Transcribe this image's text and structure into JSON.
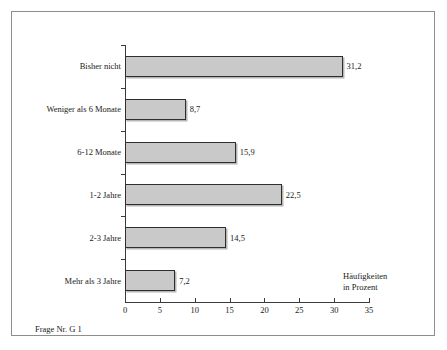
{
  "chart_data": {
    "type": "bar",
    "orientation": "horizontal",
    "title": "",
    "xlabel": "Häufigkeiten in Prozent",
    "ylabel": "",
    "categories": [
      "Bisher nicht",
      "Weniger als 6 Monate",
      "6-12 Monate",
      "1-2 Jahre",
      "2-3 Jahre",
      "Mehr als 3 Jahre"
    ],
    "values": [
      31.2,
      8.7,
      15.9,
      22.5,
      14.5,
      7.2
    ],
    "value_labels": [
      "31,2",
      "8,7",
      "15,9",
      "22,5",
      "14,5",
      "7,2"
    ],
    "xlim": [
      0,
      35
    ],
    "xticks": [
      0,
      5,
      10,
      15,
      20,
      25,
      30,
      35
    ],
    "xtick_labels": [
      "0",
      "5",
      "10",
      "15",
      "20",
      "25",
      "30",
      "35"
    ],
    "grid": false,
    "legend": null,
    "bar_color": "#c9c9c9",
    "bar_border_color": "#2e2e2e"
  },
  "axis_title": {
    "line1": "Häufigkeiten",
    "line2": "in Prozent"
  },
  "footnote": "Frage Nr. G 1"
}
